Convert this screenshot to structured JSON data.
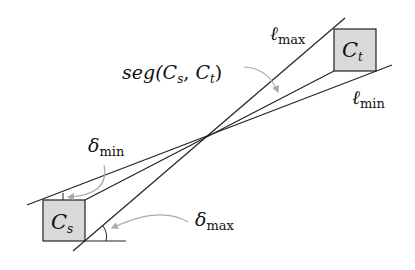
{
  "diagram": {
    "boxes": [
      {
        "id": "Cs",
        "label_main": "C",
        "label_sub": "s",
        "x": 43,
        "y": 200,
        "w": 42,
        "h": 41
      },
      {
        "id": "Ct",
        "label_main": "C",
        "label_sub": "t",
        "x": 334,
        "y": 29,
        "w": 42,
        "h": 42
      }
    ],
    "lines": {
      "l_max": {
        "x1": 73,
        "y1": 251,
        "x2": 345,
        "y2": 18
      },
      "l_min": {
        "x1": 27,
        "y1": 205,
        "x2": 392,
        "y2": 65
      },
      "seg": {
        "x1": 43,
        "y1": 200,
        "x2": 334,
        "y2": 71
      },
      "baseline": {
        "x1": 85,
        "y1": 241,
        "x2": 126,
        "y2": 241
      }
    },
    "labels": {
      "l_max": {
        "main": "ℓ",
        "sub": "max"
      },
      "l_min": {
        "main": "ℓ",
        "sub": "min"
      },
      "seg": {
        "prefix": "seg(",
        "c1": "C",
        "s1": "s",
        "comma": ", ",
        "c2": "C",
        "s2": "t",
        "suffix": ")"
      },
      "delta_min": {
        "main": "δ",
        "sub": "min"
      },
      "delta_max": {
        "main": "δ",
        "sub": "max"
      }
    },
    "colors": {
      "box_fill": "#d9d9d9",
      "line": "#222222",
      "arrow": "#aaaaaa"
    }
  }
}
